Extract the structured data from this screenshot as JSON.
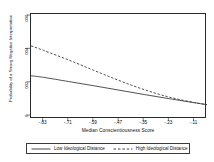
{
  "chart_data": {
    "type": "line",
    "title": "",
    "xlabel": "Median Conscientiousness Score",
    "ylabel": "Probability of a Strong Negative Interpretation",
    "xlim": [
      -0.89,
      -0.05
    ],
    "ylim": [
      0,
      0.006
    ],
    "grid": false,
    "legend_position": "bottom",
    "xticklabels": [
      "-.83",
      "-.71",
      "-.59",
      "-.47",
      "-.35",
      "-.23",
      "-.11"
    ],
    "xtickvalues": [
      -0.83,
      -0.71,
      -0.59,
      -0.47,
      -0.35,
      -0.23,
      -0.11
    ],
    "yticklabels": [
      ".006",
      ".004",
      ".002",
      "0"
    ],
    "ytickvalues": [
      0.006,
      0.004,
      0.002,
      0
    ],
    "series": [
      {
        "name": "Low Ideological Distance",
        "style": "solid",
        "color": "#333333",
        "x": [
          -0.89,
          -0.83,
          -0.71,
          -0.59,
          -0.47,
          -0.35,
          -0.23,
          -0.11,
          -0.05
        ],
        "values": [
          0.00247,
          0.00238,
          0.00214,
          0.0019,
          0.00165,
          0.0014,
          0.00116,
          0.00093,
          0.00082
        ]
      },
      {
        "name": "High Ideological Distance",
        "style": "dashed",
        "color": "#333333",
        "x": [
          -0.89,
          -0.83,
          -0.71,
          -0.59,
          -0.47,
          -0.35,
          -0.23,
          -0.11,
          -0.05
        ],
        "values": [
          0.00418,
          0.00392,
          0.00337,
          0.00278,
          0.0022,
          0.00168,
          0.00125,
          0.00094,
          0.00082
        ]
      }
    ]
  },
  "legend": {
    "entries": [
      {
        "label": "Low Ideological Distance",
        "style": "solid"
      },
      {
        "label": "High Ideological Distance",
        "style": "dashed"
      }
    ]
  },
  "axes": {
    "y_title": "Probability of a Strong Negative Interpretation",
    "x_title": "Median Conscientiousness Score"
  }
}
